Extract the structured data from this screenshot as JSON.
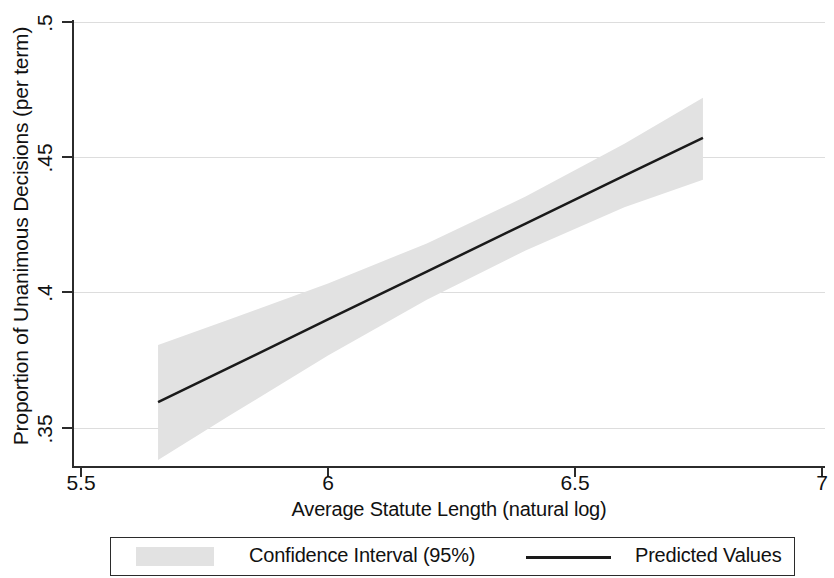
{
  "chart_data": {
    "type": "line",
    "title": "",
    "subtitle": "",
    "xlabel": "Average Statute Length (natural log)",
    "ylabel": "Proportion of Unanimous Decisions (per term)",
    "xlim": [
      5.5,
      7
    ],
    "ylim": [
      0.34,
      0.5
    ],
    "xticks": [
      5.5,
      6,
      6.5,
      7
    ],
    "xtick_labels": [
      "5.5",
      "6",
      "6.5",
      "7"
    ],
    "yticks": [
      0.35,
      0.4,
      0.45,
      0.5
    ],
    "ytick_labels": [
      ".35",
      ".4",
      ".45",
      ".5"
    ],
    "grid": true,
    "grid_axis": "y",
    "legend_position": "below",
    "series": [
      {
        "name": "Predicted Values",
        "type": "line",
        "color": "#1a1a1a",
        "linewidth": 2.5,
        "x": [
          5.656,
          5.8,
          6.0,
          6.2,
          6.4,
          6.6,
          6.759
        ],
        "values": [
          0.3596,
          0.3723,
          0.3901,
          0.4078,
          0.4255,
          0.4432,
          0.4572
        ]
      },
      {
        "name": "Confidence Interval (95%)",
        "type": "band",
        "color": "#e2e2e2",
        "x": [
          5.656,
          5.8,
          6.0,
          6.2,
          6.4,
          6.6,
          6.759
        ],
        "lower": [
          0.3382,
          0.3545,
          0.3768,
          0.3974,
          0.4156,
          0.4316,
          0.4417
        ],
        "upper": [
          0.3807,
          0.3901,
          0.4034,
          0.4182,
          0.4355,
          0.455,
          0.472
        ]
      }
    ]
  },
  "axes": {
    "y_title": "Proportion of Unanimous Decisions (per term)",
    "x_title": "Average Statute Length (natural log)",
    "y_tick_labels": [
      ".5",
      ".45",
      ".4",
      ".35"
    ],
    "x_tick_labels": [
      "5.5",
      "6",
      "6.5",
      "7"
    ]
  },
  "legend": {
    "ci_label": "Confidence Interval (95%)",
    "pv_label": "Predicted Values",
    "ci_color": "#e2e2e2",
    "pv_color": "#1a1a1a"
  }
}
